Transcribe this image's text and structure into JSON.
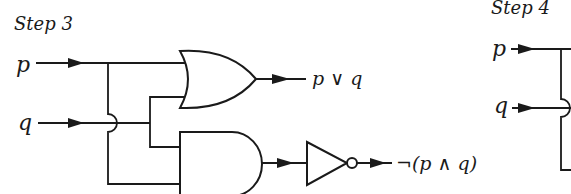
{
  "panels": [
    {
      "title": "Step 3",
      "inputs": [
        "p",
        "q"
      ],
      "gates": [
        "OR",
        "AND",
        "NOT"
      ],
      "outputs": [
        "p ∨ q",
        "¬(p ∧ q)"
      ]
    },
    {
      "title": "Step 4",
      "inputs": [
        "p",
        "q"
      ]
    }
  ],
  "colors": {
    "ink": "#1a1a1a",
    "background": "#ffffff"
  }
}
